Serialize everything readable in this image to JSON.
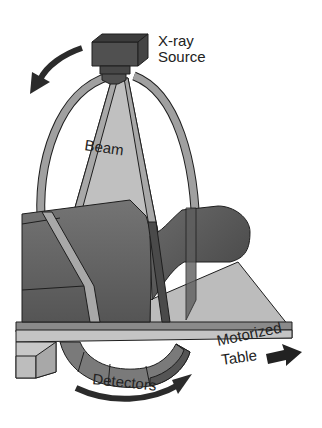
{
  "diagram": {
    "labels": {
      "xray_line1": "X-ray",
      "xray_line2": "Source",
      "beam": "Beam",
      "motorized": "Motorized",
      "table": "Table",
      "detectors": "Detectors"
    },
    "components": [
      "x-ray-source",
      "beam",
      "gantry-ring",
      "patient",
      "motorized-table",
      "detector-array"
    ],
    "arrows": [
      "rotation-arrow-top",
      "rotation-arrow-bottom",
      "table-direction-arrow"
    ],
    "colors": {
      "background": "#ffffff",
      "source": "#4a4a4a",
      "beam": "#bdbdbd",
      "ring": "#9a9a9a",
      "patient": "#6e6e6e",
      "table": "#b8b8b8",
      "detector": "#7a7a7a",
      "arrow": "#2b2b2b",
      "outline": "#1e1e1e"
    }
  }
}
